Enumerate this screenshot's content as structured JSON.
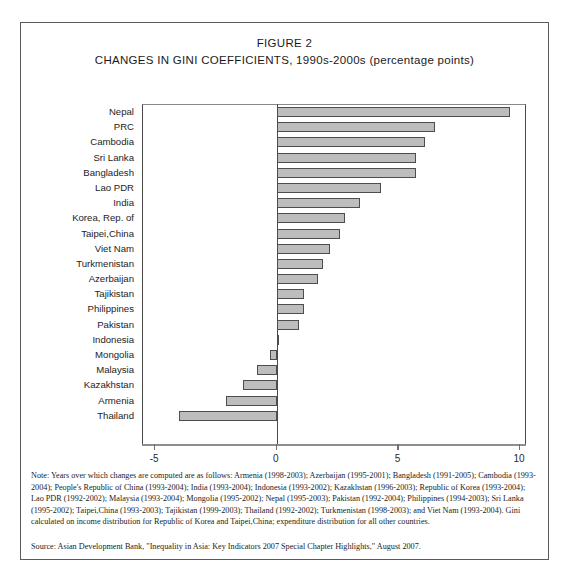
{
  "figure": {
    "title_line1": "FIGURE 2",
    "title_line2": "CHANGES IN GINI COEFFICIENTS, 1990s-2000s (percentage points)",
    "note": "Note: Years over which changes are computed are as follows: Armenia (1998-2003); Azerbaijan (1995-2001); Bangladesh (1991-2005); Cambodia (1993-2004); People's Republic of China (1993-2004); India (1993-2004); Indonesia (1993-2002); Kazakhstan (1996-2003); Republic of Korea (1993-2004); Lao PDR (1992-2002); Malaysia (1993-2004); Mongolia (1995-2002); Nepal (1995-2003); Pakistan (1992-2004); Philippines (1994-2003); Sri Lanka (1995-2002); Taipei,China (1993-2003); Tajikistan (1999-2003); Thailand (1992-2002); Turkmenistan (1998-2003); and Viet Nam (1993-2004). Gini calculated on income distribution for Republic of Korea and Taipei,China; expenditure distribution for all other countries.",
    "source": "Source: Asian Development Bank, \"Inequality in Asia: Key Indicators 2007 Special Chapter Highlights,\" August 2007.",
    "bar_fill_color": "#bdbdbd",
    "bar_border_color": "#4d4d4d",
    "axis_color": "#4a4a4a",
    "border_color": "#5a5a5a"
  },
  "chart_data": {
    "type": "bar",
    "orientation": "horizontal",
    "title": "CHANGES IN GINI COEFFICIENTS, 1990s-2000s (percentage points)",
    "xlabel": "",
    "ylabel": "",
    "xlim": [
      -5.5,
      10.2
    ],
    "xticks": [
      -5,
      0,
      5,
      10
    ],
    "xticklabels": [
      "-5",
      "0",
      "5",
      "10"
    ],
    "grid": false,
    "legend": null,
    "categories": [
      "Nepal",
      "PRC",
      "Cambodia",
      "Sri Lanka",
      "Bangladesh",
      "Lao PDR",
      "India",
      "Korea, Rep. of",
      "Taipei,China",
      "Viet Nam",
      "Turkmenistan",
      "Azerbaijan",
      "Tajikistan",
      "Philippines",
      "Pakistan",
      "Indonesia",
      "Mongolia",
      "Malaysia",
      "Kazakhstan",
      "Armenia",
      "Thailand"
    ],
    "values": [
      9.6,
      6.5,
      6.1,
      5.7,
      5.7,
      4.3,
      3.4,
      2.8,
      2.6,
      2.2,
      1.9,
      1.7,
      1.1,
      1.1,
      0.9,
      0.05,
      -0.3,
      -0.8,
      -1.4,
      -2.1,
      -4.0
    ]
  }
}
